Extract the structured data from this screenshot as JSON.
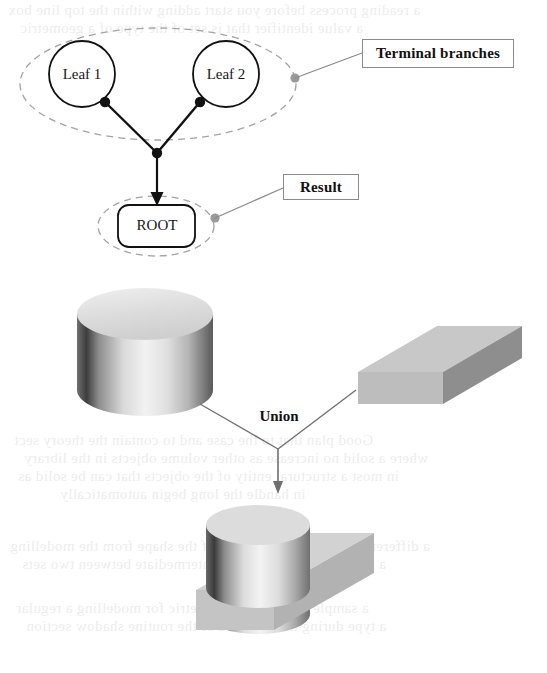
{
  "figure": {
    "type": "csg-union-diagram",
    "tree": {
      "leaves": [
        {
          "id": "leaf1",
          "label": "Leaf 1",
          "cx": 82,
          "cy": 74,
          "r": 33
        },
        {
          "id": "leaf2",
          "label": "Leaf 2",
          "cx": 226,
          "cy": 74,
          "r": 33
        }
      ],
      "root": {
        "label": "ROOT",
        "x": 118,
        "y": 205,
        "w": 77,
        "h": 42
      },
      "junction": {
        "x": 157,
        "y": 153
      },
      "branch_dots": [
        {
          "x": 105,
          "y": 102
        },
        {
          "x": 200,
          "y": 102
        }
      ],
      "grouping_ellipses": [
        {
          "id": "terminal-group",
          "cx": 158,
          "cy": 84,
          "rx": 138,
          "ry": 56
        },
        {
          "id": "result-group",
          "cx": 156,
          "cy": 226,
          "rx": 58,
          "ry": 30
        }
      ],
      "callouts": [
        {
          "id": "terminal-branches",
          "label": "Terminal branches",
          "anchor": {
            "x": 295,
            "y": 78
          }
        },
        {
          "id": "result",
          "label": "Result",
          "anchor": {
            "x": 215,
            "y": 218
          }
        }
      ]
    },
    "operation": {
      "label": "Union",
      "operands": [
        {
          "id": "cylinder",
          "shape": "cylinder"
        },
        {
          "id": "box",
          "shape": "rectangular-block"
        }
      ],
      "result": {
        "id": "union-solid",
        "shape": "cylinder-on-block"
      }
    },
    "colors": {
      "ink": "#111111",
      "callout_line": "#8a8a8a",
      "callout_dot": "#9a9a9a",
      "dashed_ellipse": "#a0a0a0",
      "solid_light": "#e2e2e2",
      "solid_mid": "#b9b9b9",
      "solid_dark": "#8e8e8e",
      "background": "#ffffff"
    }
  },
  "page_showthrough": {
    "visible": true,
    "lines": [
      "a reading process before you start adding within the top line box",
      "a value identifier that is set of the type of a geometric",
      "Good plan that to the case and to contain the theory sect",
      "where a solid no increase as other volume objects in the library",
      "in most a structural entity of the objects that can be solid as",
      "in handle    the long begin automatically",
      "a different display limit and a set of the shape from the modelling",
      "a member and solve about intermediate between two sets",
      "a sample a boolean a geometric for modelling a regular",
      "a type during the recorded of the routine shadow section"
    ]
  }
}
